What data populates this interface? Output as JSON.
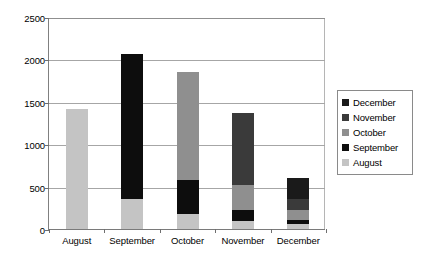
{
  "chart_data": {
    "type": "bar",
    "subtype": "stacked-column",
    "title": "",
    "xlabel": "",
    "ylabel": "",
    "categories": [
      "August",
      "September",
      "October",
      "November",
      "December"
    ],
    "series": [
      {
        "name": "August",
        "color": "#c4c4c4",
        "values": [
          1415,
          350,
          180,
          100,
          60
        ]
      },
      {
        "name": "September",
        "color": "#0d0d0d",
        "values": [
          0,
          1710,
          400,
          130,
          50
        ]
      },
      {
        "name": "October",
        "color": "#8f8f8f",
        "values": [
          0,
          0,
          1270,
          290,
          110
        ]
      },
      {
        "name": "November",
        "color": "#3a3a3a",
        "values": [
          0,
          0,
          0,
          850,
          140
        ]
      },
      {
        "name": "December",
        "color": "#1a1a1a",
        "values": [
          0,
          0,
          0,
          0,
          240
        ]
      }
    ],
    "totals": [
      1415,
      2060,
      1850,
      1370,
      600
    ],
    "ylim": [
      0,
      2500
    ],
    "ytick_values": [
      0,
      500,
      1000,
      1500,
      2000,
      2500
    ],
    "ytick_labels": [
      "0",
      "500",
      "1000",
      "1500",
      "2000",
      "2500"
    ],
    "grid": true,
    "grid_axis": "y",
    "legend_position": "right",
    "legend_order": [
      "December",
      "November",
      "October",
      "September",
      "August"
    ]
  },
  "legend": {
    "items": [
      {
        "label": "December",
        "color": "#1a1a1a"
      },
      {
        "label": "November",
        "color": "#3a3a3a"
      },
      {
        "label": "October",
        "color": "#8f8f8f"
      },
      {
        "label": "September",
        "color": "#0d0d0d"
      },
      {
        "label": "August",
        "color": "#c4c4c4"
      }
    ]
  }
}
